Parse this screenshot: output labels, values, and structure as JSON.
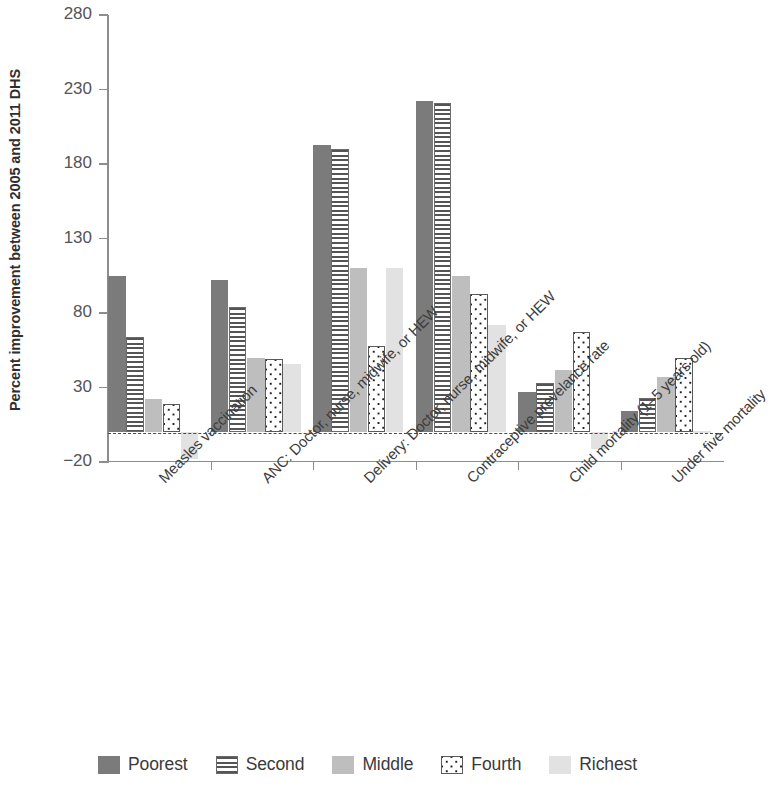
{
  "chart_data": {
    "type": "bar",
    "title": "",
    "subtitle": "",
    "xlabel": "",
    "ylabel": "Percent improvement between 2005 and 2011 DHS",
    "ylim": [
      -20,
      280
    ],
    "yticks": [
      280,
      230,
      180,
      130,
      80,
      30,
      -20
    ],
    "ytick_labels": [
      "280",
      "230",
      "180",
      "130",
      "80",
      "30",
      "−20"
    ],
    "grid": false,
    "zero_line": 0,
    "legend_position": "bottom",
    "categories": [
      "Measles vaccination",
      "ANC: Doctor, nurse, midwife, or HEW",
      "Delivery: Doctor, nurse, midwife, or HEW",
      "Contraceptive prevelance rate",
      "Child mortality (1–5 years old)",
      "Under five mortality"
    ],
    "series": [
      {
        "name": "Poorest",
        "pattern": "solid-dark",
        "color": "#7b7b7b",
        "values": [
          105,
          102,
          193,
          222,
          27,
          14
        ]
      },
      {
        "name": "Second",
        "pattern": "horizontal-lines",
        "color": "#555555",
        "values": [
          64,
          84,
          190,
          221,
          33,
          23
        ]
      },
      {
        "name": "Middle",
        "pattern": "solid-medium",
        "color": "#bebebe",
        "values": [
          22,
          50,
          110,
          105,
          42,
          37
        ]
      },
      {
        "name": "Fourth",
        "pattern": "dotted",
        "color": "#1d1d1d",
        "values": [
          19,
          49,
          58,
          93,
          67,
          50
        ]
      },
      {
        "name": "Richest",
        "pattern": "solid-light",
        "color": "#e2e2e2",
        "values": [
          -18,
          46,
          110,
          72,
          -11,
          1
        ]
      }
    ]
  },
  "legend": {
    "items": [
      {
        "label": "Poorest"
      },
      {
        "label": "Second"
      },
      {
        "label": "Middle"
      },
      {
        "label": "Fourth"
      },
      {
        "label": "Richest"
      }
    ]
  }
}
